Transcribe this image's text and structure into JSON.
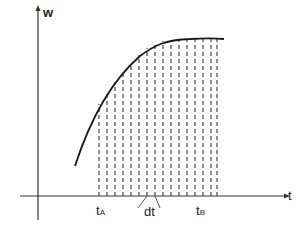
{
  "diagram": {
    "y_axis_label": "w",
    "x_axis_label": "t",
    "t_a": {
      "base": "t",
      "sub": "A"
    },
    "t_b": {
      "base": "t",
      "sub": "B"
    },
    "interval_label": "dt",
    "curve_color": "#1a1a1a",
    "dash_color": "#555555",
    "axis_color": "#333333",
    "dashed_line_count": 13
  }
}
